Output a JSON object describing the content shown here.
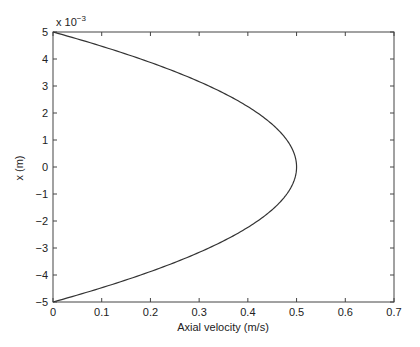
{
  "chart_data": {
    "type": "line",
    "title": "",
    "xlabel": "Axial velocity (m/s)",
    "ylabel": "x (m)",
    "y_scale_factor": "x 10",
    "y_scale_exponent": "-3",
    "xlim": [
      0,
      0.7
    ],
    "ylim": [
      -5,
      5
    ],
    "x_ticks": [
      0,
      0.1,
      0.2,
      0.3,
      0.4,
      0.5,
      0.6,
      0.7
    ],
    "x_tick_labels": [
      "0",
      "0.1",
      "0.2",
      "0.3",
      "0.4",
      "0.5",
      "0.6",
      "0.7"
    ],
    "y_ticks": [
      -5,
      -4,
      -3,
      -2,
      -1,
      0,
      1,
      2,
      3,
      4,
      5
    ],
    "y_tick_labels": [
      "−5",
      "−4",
      "−3",
      "−2",
      "−1",
      "0",
      "1",
      "2",
      "3",
      "4",
      "5"
    ],
    "grid": false,
    "legend": null,
    "series": [
      {
        "name": "velocity profile",
        "color": "#333333",
        "description": "Parabolic laminar profile u = 0.5*(1 - (x/0.005)^2)",
        "x": [
          0.0,
          0.095,
          0.18,
          0.255,
          0.32,
          0.375,
          0.42,
          0.455,
          0.48,
          0.495,
          0.5,
          0.495,
          0.48,
          0.455,
          0.42,
          0.375,
          0.32,
          0.255,
          0.18,
          0.095,
          0.0
        ],
        "y": [
          5,
          4.5,
          4,
          3.5,
          3,
          2.5,
          2,
          1.5,
          1,
          0.5,
          0,
          -0.5,
          -1,
          -1.5,
          -2,
          -2.5,
          -3,
          -3.5,
          -4,
          -4.5,
          -5
        ]
      }
    ]
  },
  "axes": {
    "xlabel": "Axial velocity (m/s)",
    "ylabel": "x (m)",
    "exponent_base": "x 10",
    "exponent_power": "−3"
  }
}
